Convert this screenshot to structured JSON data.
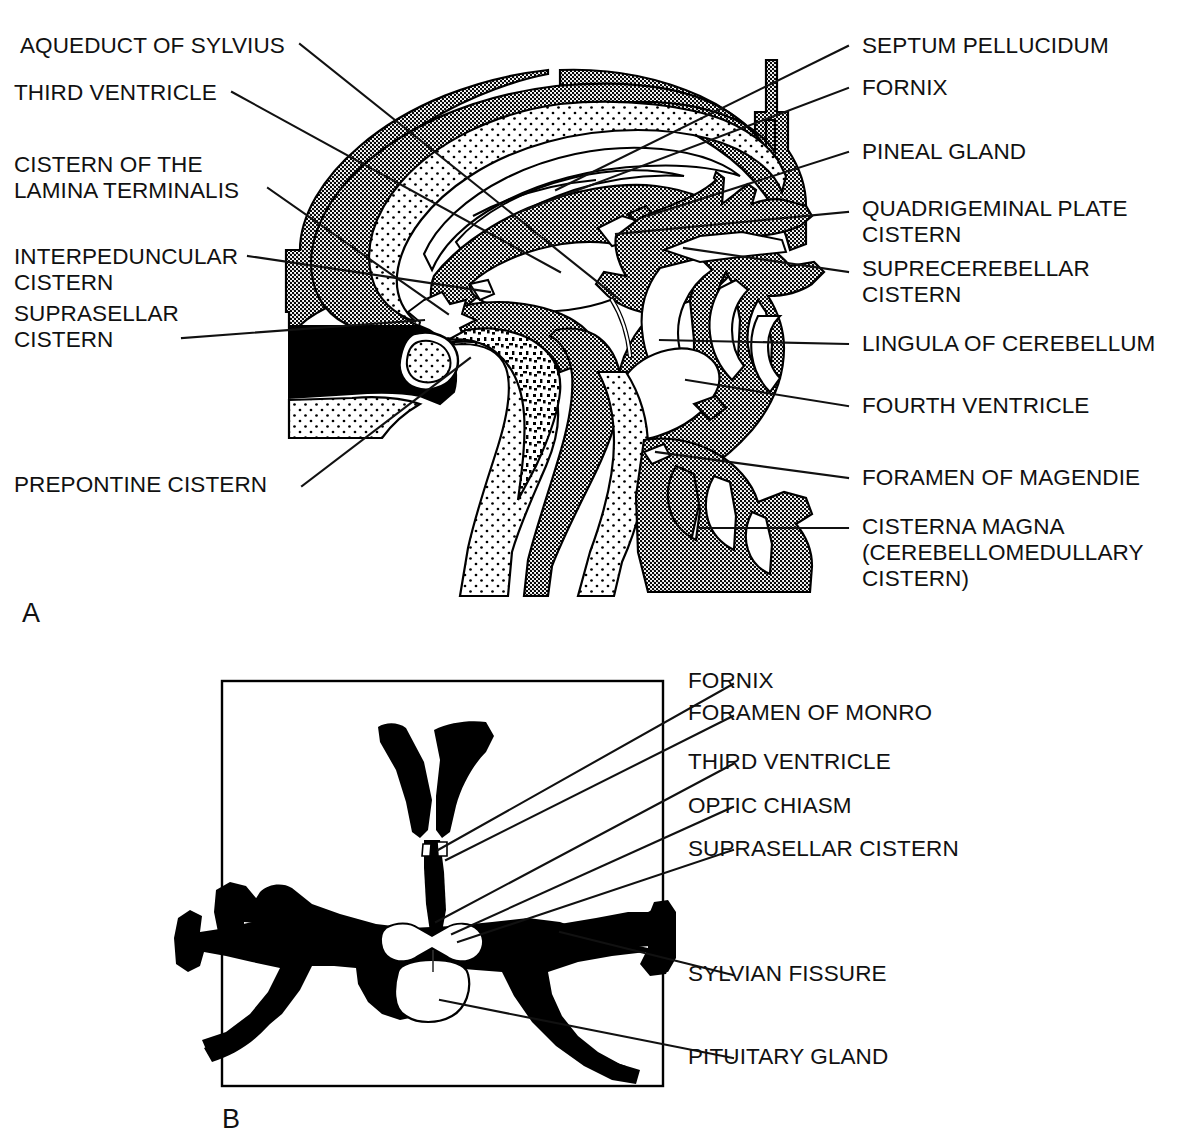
{
  "figure": {
    "panels": [
      {
        "id": "A",
        "letter": "A",
        "view": "midsagittal-section"
      },
      {
        "id": "B",
        "letter": "B",
        "view": "axial-section"
      }
    ]
  },
  "panel_a": {
    "letter": "A",
    "labels_left": [
      {
        "key": "aqueduct_of_sylvius",
        "text": "AQUEDUCT OF SYLVIUS"
      },
      {
        "key": "third_ventricle",
        "text": "THIRD VENTRICLE"
      },
      {
        "key": "cistern_lamina_terminalis",
        "text": "CISTERN OF THE\nLAMINA TERMINALIS"
      },
      {
        "key": "interpeduncular_cistern",
        "text": "INTERPEDUNCULAR\nCISTERN"
      },
      {
        "key": "suprasellar_cistern",
        "text": "SUPRASELLAR\nCISTERN"
      },
      {
        "key": "prepontine_cistern",
        "text": "PREPONTINE CISTERN"
      }
    ],
    "labels_right": [
      {
        "key": "septum_pellucidum",
        "text": "SEPTUM PELLUCIDUM"
      },
      {
        "key": "fornix",
        "text": "FORNIX"
      },
      {
        "key": "pineal_gland",
        "text": "PINEAL GLAND"
      },
      {
        "key": "quadrigeminal_plate_cistern",
        "text": "QUADRIGEMINAL PLATE\nCISTERN"
      },
      {
        "key": "suprecerebellar_cistern",
        "text": "SUPRECEREBELLAR\nCISTERN"
      },
      {
        "key": "lingula_of_cerebellum",
        "text": "LINGULA OF CEREBELLUM"
      },
      {
        "key": "fourth_ventricle",
        "text": "FOURTH VENTRICLE"
      },
      {
        "key": "foramen_of_magendie",
        "text": "FORAMEN OF MAGENDIE"
      },
      {
        "key": "cisterna_magna",
        "text": "CISTERNA MAGNA\n(CEREBELLOMEDULLARY\nCISTERN)"
      }
    ]
  },
  "panel_b": {
    "letter": "B",
    "labels_right": [
      {
        "key": "fornix",
        "text": "FORNIX"
      },
      {
        "key": "foramen_of_monro",
        "text": "FORAMEN OF MONRO"
      },
      {
        "key": "third_ventricle",
        "text": "THIRD VENTRICLE"
      },
      {
        "key": "optic_chiasm",
        "text": "OPTIC CHIASM"
      },
      {
        "key": "suprasellar_cistern",
        "text": "SUPRASELLAR CISTERN"
      },
      {
        "key": "sylvian_fissure",
        "text": "SYLVIAN FISSURE"
      },
      {
        "key": "pituitary_gland",
        "text": "PITUITARY GLAND"
      }
    ]
  },
  "colors": {
    "ink": "#111111",
    "fill_black": "#000000",
    "fill_white": "#ffffff",
    "stipple_light": "#ffffff",
    "stipple_dark": "#595959",
    "background": "#ffffff"
  }
}
